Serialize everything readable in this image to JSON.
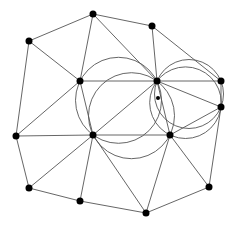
{
  "diagram": {
    "type": "delaunay-triangulation-with-circumcircles",
    "colors": {
      "background": "#ffffff",
      "edge": "#555555",
      "node": "#000000"
    },
    "nodes": [
      {
        "id": "A",
        "x": 93,
        "y": 14,
        "r": 3.5
      },
      {
        "id": "B",
        "x": 29,
        "y": 41,
        "r": 3.5
      },
      {
        "id": "C",
        "x": 152,
        "y": 26,
        "r": 3.5
      },
      {
        "id": "D",
        "x": 80,
        "y": 81,
        "r": 3.5
      },
      {
        "id": "E",
        "x": 157,
        "y": 81,
        "r": 3.5
      },
      {
        "id": "F",
        "x": 221,
        "y": 81,
        "r": 3.5
      },
      {
        "id": "G",
        "x": 221,
        "y": 107,
        "r": 3.5
      },
      {
        "id": "H",
        "x": 16,
        "y": 136,
        "r": 3.5
      },
      {
        "id": "I",
        "x": 93,
        "y": 135,
        "r": 3.5
      },
      {
        "id": "J",
        "x": 170,
        "y": 135,
        "r": 3.5
      },
      {
        "id": "K",
        "x": 29,
        "y": 188,
        "r": 3.5
      },
      {
        "id": "L",
        "x": 80,
        "y": 201,
        "r": 3.5
      },
      {
        "id": "M",
        "x": 146,
        "y": 213,
        "r": 3.5
      },
      {
        "id": "N",
        "x": 209,
        "y": 187,
        "r": 3.5
      },
      {
        "id": "P",
        "x": 158,
        "y": 98,
        "r": 2
      }
    ],
    "edges": [
      [
        "A",
        "B"
      ],
      [
        "A",
        "C"
      ],
      [
        "A",
        "D"
      ],
      [
        "A",
        "E"
      ],
      [
        "C",
        "E"
      ],
      [
        "C",
        "F"
      ],
      [
        "B",
        "D"
      ],
      [
        "B",
        "H"
      ],
      [
        "D",
        "E"
      ],
      [
        "D",
        "H"
      ],
      [
        "D",
        "I"
      ],
      [
        "E",
        "F"
      ],
      [
        "E",
        "G"
      ],
      [
        "E",
        "I"
      ],
      [
        "E",
        "J"
      ],
      [
        "F",
        "G"
      ],
      [
        "G",
        "J"
      ],
      [
        "G",
        "N"
      ],
      [
        "H",
        "I"
      ],
      [
        "H",
        "K"
      ],
      [
        "I",
        "J"
      ],
      [
        "I",
        "K"
      ],
      [
        "I",
        "L"
      ],
      [
        "I",
        "M"
      ],
      [
        "J",
        "M"
      ],
      [
        "J",
        "N"
      ],
      [
        "K",
        "L"
      ],
      [
        "L",
        "M"
      ],
      [
        "M",
        "N"
      ]
    ],
    "circles": [
      {
        "through": [
          "D",
          "E",
          "I"
        ],
        "cx": 118.5,
        "cy": 100.3,
        "r": 43
      },
      {
        "through": [
          "E",
          "I",
          "J"
        ],
        "cx": 131.5,
        "cy": 115.7,
        "r": 43
      },
      {
        "through": [
          "E",
          "F",
          "G"
        ],
        "cx": 189,
        "cy": 94,
        "r": 34.5
      },
      {
        "through": [
          "E",
          "G",
          "J"
        ],
        "cx": 185.5,
        "cy": 102.7,
        "r": 35.8
      }
    ]
  }
}
